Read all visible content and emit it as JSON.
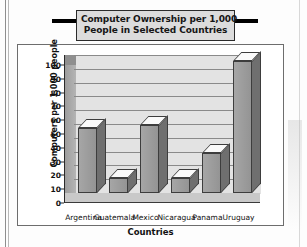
{
  "title": {
    "line1": "Computer Ownership per 1,000",
    "line2": "People in Selected Countries"
  },
  "axes": {
    "ylabel": "Computers per 1,000 people",
    "xlabel": "Countries"
  },
  "chart_data": {
    "type": "bar",
    "title": "Computer Ownership per 1,000 People in Selected Countries",
    "xlabel": "Countries",
    "ylabel": "Computers per 1,000 people",
    "categories": [
      "Argentina",
      "Guatemala",
      "Mexico",
      "Nicaragua",
      "Panama",
      "Uruguay"
    ],
    "values": [
      47,
      11,
      49,
      11,
      29,
      96
    ],
    "ylim": [
      0,
      100
    ],
    "yticks": [
      0,
      10,
      20,
      30,
      40,
      50,
      60,
      70,
      80,
      90,
      100
    ],
    "ytick_labels": [
      "0",
      "10",
      "20",
      "30",
      "40",
      "50",
      "60",
      "70",
      "80",
      "90",
      "100"
    ],
    "grid": true,
    "legend": false,
    "style": "3d-column",
    "colors": {
      "bar_face": "#9c9c9c",
      "bar_side": "#6f6f6f",
      "bar_top": "#fafafa",
      "plot_background": "#e3e3e3",
      "gridline": "#8a8a8a",
      "axis": "#2a2a2a",
      "title_box_fill": "#dcdcdc",
      "title_rule": "#000000",
      "text": "#111111"
    }
  }
}
